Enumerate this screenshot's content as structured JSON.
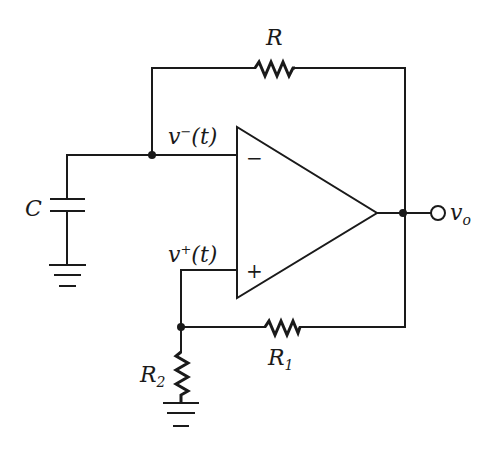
{
  "diagram": {
    "type": "op-amp circuit (relaxation oscillator / astable multivibrator)",
    "colors": {
      "stroke": "#1a1a1a",
      "background": "#ffffff"
    },
    "components": {
      "feedback_resistor": {
        "label": "R"
      },
      "capacitor": {
        "label": "C"
      },
      "resistor_r1": {
        "label": "R",
        "subscript": "1"
      },
      "resistor_r2": {
        "label": "R",
        "subscript": "2"
      },
      "opamp": {
        "inverting_sign": "−",
        "noninverting_sign": "+"
      }
    },
    "nodes": {
      "inverting_input": {
        "label": "v",
        "superscript": "−",
        "arg": "(t)"
      },
      "noninverting_input": {
        "label": "v",
        "superscript": "+",
        "arg": "(t)"
      },
      "output": {
        "label": "v",
        "subscript": "o"
      }
    },
    "grounds": [
      "capacitor-ground",
      "r2-ground"
    ]
  }
}
